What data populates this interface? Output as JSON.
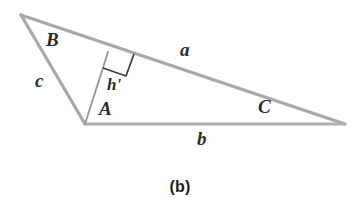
{
  "figure": {
    "caption": "(b)",
    "type": "geometry-diagram",
    "colors": {
      "background": "#ffffff",
      "stroke": "#a8a8a8",
      "altitude_stroke": "#8f8f8f",
      "right_angle_stroke": "#3a3a3a",
      "label_text": "#2b2b2b",
      "caption_text": "#1c1c1c"
    },
    "vertices": [
      {
        "name": "B",
        "label": "B",
        "x": 21,
        "y": 15
      },
      {
        "name": "A",
        "label": "A",
        "x": 85,
        "y": 124
      },
      {
        "name": "C",
        "label": "C",
        "x": 345,
        "y": 124
      }
    ],
    "sides": [
      {
        "name": "a",
        "label": "a",
        "from": "B",
        "to": "C"
      },
      {
        "name": "b",
        "label": "b",
        "from": "A",
        "to": "C"
      },
      {
        "name": "c",
        "label": "c",
        "from": "B",
        "to": "A"
      }
    ],
    "altitude": {
      "label": "h'",
      "from": "A",
      "foot_x": 108,
      "foot_y": 52,
      "right_angle_marker": true
    },
    "labels": {
      "vertex_B": {
        "text": "B",
        "x": 46,
        "y": 30
      },
      "vertex_A": {
        "text": "A",
        "x": 99,
        "y": 99
      },
      "vertex_C": {
        "text": "C",
        "x": 258,
        "y": 97
      },
      "side_a": {
        "text": "a",
        "x": 180,
        "y": 40
      },
      "side_b": {
        "text": "b",
        "x": 197,
        "y": 129
      },
      "side_c": {
        "text": "c",
        "x": 35,
        "y": 71
      },
      "altitude_h": {
        "text": "h'",
        "x": 107,
        "y": 76
      }
    },
    "caption_position": {
      "x": 0,
      "y": 178
    }
  }
}
